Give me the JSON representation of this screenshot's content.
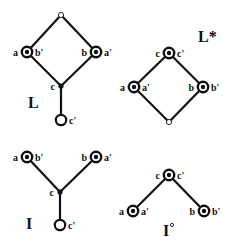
{
  "colors": {
    "ink": "#111111",
    "background": "#ffffff"
  },
  "diagrams": [
    {
      "id": "L",
      "title": "L",
      "title_pos": [
        28,
        108
      ],
      "title_sup": "",
      "nodes": [
        {
          "id": "top",
          "x": 61,
          "y": 15,
          "type": "small-open",
          "left": "",
          "right": ""
        },
        {
          "id": "a",
          "x": 27,
          "y": 52,
          "type": "double",
          "left": "a",
          "right": "b'"
        },
        {
          "id": "b",
          "x": 96,
          "y": 52,
          "type": "double",
          "left": "b",
          "right": "a'"
        },
        {
          "id": "c",
          "x": 61,
          "y": 86,
          "type": "dot",
          "left": "c",
          "right": ""
        },
        {
          "id": "c'",
          "x": 61,
          "y": 120,
          "type": "open",
          "left": "",
          "right": "c'"
        }
      ],
      "edges": [
        [
          "top",
          "a"
        ],
        [
          "top",
          "b"
        ],
        [
          "a",
          "c"
        ],
        [
          "b",
          "c"
        ],
        [
          "c",
          "c'"
        ]
      ]
    },
    {
      "id": "L*",
      "title": "L*",
      "title_pos": [
        198,
        42
      ],
      "title_sup": "",
      "nodes": [
        {
          "id": "c",
          "x": 169,
          "y": 53,
          "type": "double",
          "left": "c",
          "right": "c'"
        },
        {
          "id": "a",
          "x": 134,
          "y": 87,
          "type": "double",
          "left": "a",
          "right": "a'"
        },
        {
          "id": "b",
          "x": 203,
          "y": 87,
          "type": "double",
          "left": "b",
          "right": "b'"
        },
        {
          "id": "bot",
          "x": 169,
          "y": 122,
          "type": "small-open",
          "left": "",
          "right": ""
        }
      ],
      "edges": [
        [
          "c",
          "a"
        ],
        [
          "c",
          "b"
        ],
        [
          "a",
          "bot"
        ],
        [
          "b",
          "bot"
        ]
      ]
    },
    {
      "id": "I",
      "title": "I",
      "title_pos": [
        26,
        229
      ],
      "title_sup": "",
      "nodes": [
        {
          "id": "a",
          "x": 27,
          "y": 157,
          "type": "double",
          "left": "a",
          "right": "b'"
        },
        {
          "id": "b",
          "x": 96,
          "y": 157,
          "type": "double",
          "left": "b",
          "right": "a'"
        },
        {
          "id": "c",
          "x": 60,
          "y": 192,
          "type": "dot",
          "left": "c",
          "right": ""
        },
        {
          "id": "c'",
          "x": 60,
          "y": 225,
          "type": "open",
          "left": "",
          "right": "c'"
        }
      ],
      "edges": [
        [
          "a",
          "c"
        ],
        [
          "b",
          "c"
        ],
        [
          "c",
          "c'"
        ]
      ]
    },
    {
      "id": "I°",
      "title": "I",
      "title_pos": [
        163,
        236
      ],
      "title_sup": "o",
      "nodes": [
        {
          "id": "c",
          "x": 169,
          "y": 175,
          "type": "double",
          "left": "c",
          "right": "c'"
        },
        {
          "id": "a",
          "x": 133,
          "y": 211,
          "type": "double",
          "left": "a",
          "right": "a'"
        },
        {
          "id": "b",
          "x": 204,
          "y": 211,
          "type": "double",
          "left": "b",
          "right": "b'"
        }
      ],
      "edges": [
        [
          "c",
          "a"
        ],
        [
          "c",
          "b"
        ]
      ]
    }
  ]
}
